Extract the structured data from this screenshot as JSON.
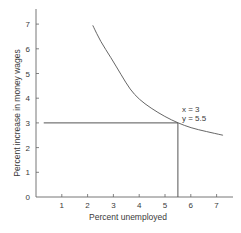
{
  "chart_data": {
    "type": "line",
    "title": "",
    "xlabel": "Percent unemployed",
    "ylabel": "Percent increase in money wages",
    "xlim": [
      0,
      7.5
    ],
    "ylim": [
      0,
      7.6
    ],
    "x_ticks": [
      1,
      2,
      3,
      4,
      5,
      6,
      7
    ],
    "y_ticks": [
      0,
      1,
      2,
      3,
      4,
      5,
      6,
      7
    ],
    "grid": false,
    "legend": null,
    "series": [
      {
        "name": "Phillips curve",
        "x": [
          2.2,
          2.5,
          2.9,
          3.3,
          3.65,
          4.0,
          4.45,
          5.0,
          5.5,
          6.0,
          6.6,
          7.25
        ],
        "y": [
          6.95,
          6.3,
          5.65,
          4.95,
          4.35,
          3.95,
          3.6,
          3.25,
          3.0,
          2.8,
          2.65,
          2.5
        ]
      }
    ],
    "reference_lines": {
      "horizontal": {
        "y": 3,
        "x_from": 0.3,
        "x_to": 5.5
      },
      "vertical": {
        "x": 5.5,
        "y_from": 0,
        "y_to": 3
      }
    },
    "annotations": [
      {
        "text": "x = 3",
        "x": 5.7,
        "y": 3.5
      },
      {
        "text": "y = 5.5",
        "x": 5.7,
        "y": 3.15
      }
    ],
    "colors": {
      "line": "#555555",
      "axis": "#666666",
      "text": "#3a3a3a"
    }
  },
  "labels": {
    "xlabel": "Percent unemployed",
    "ylabel": "Percent increase in money wages",
    "annot_x": "x = 3",
    "annot_y": "y = 5.5",
    "xticks": [
      "1",
      "2",
      "3",
      "4",
      "5",
      "6",
      "7"
    ],
    "yticks": [
      "0",
      "1",
      "2",
      "3",
      "4",
      "5",
      "6",
      "7"
    ]
  }
}
